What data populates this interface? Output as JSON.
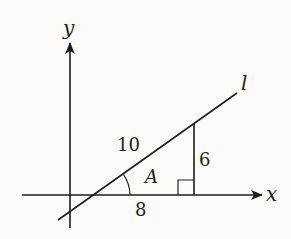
{
  "diagram": {
    "type": "right-triangle-on-coordinate-axes",
    "axes": {
      "x_label": "x",
      "y_label": "y"
    },
    "line": {
      "label": "l"
    },
    "triangle": {
      "hypotenuse_label": "10",
      "opposite_label": "6",
      "adjacent_label": "8",
      "angle_label": "A",
      "right_angle_marker": true
    },
    "colors": {
      "ink": "#1e1e1e",
      "background": "#fbfbfa"
    }
  }
}
